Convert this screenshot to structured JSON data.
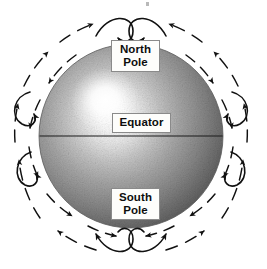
{
  "figure": {
    "background_color": "#ffffff",
    "width": 267,
    "height": 269
  },
  "labels": {
    "north_pole": "North\nPole",
    "equator": "Equator",
    "south_pole": "South\nPole"
  },
  "sphere": {
    "center_x": 131,
    "center_y": 136,
    "radius": 92,
    "highlight_x": 105,
    "highlight_y": 100,
    "shade_light": "#ffffff",
    "shade_mid": "#9a9a9a",
    "shade_dark": "#3b3b3b",
    "equator_line_color": "#1a1a1a"
  },
  "field_lines": {
    "stroke_color": "#111111",
    "description": "Dashed arrow arcs forming closed dipole loops from north pole to south pole",
    "ring_radii": [
      104,
      124
    ],
    "pole_loop_count": 4
  }
}
